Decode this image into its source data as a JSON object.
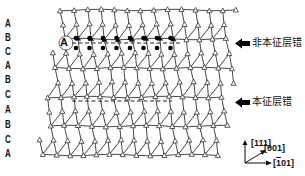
{
  "figure": {
    "stacking_sequence": [
      "A",
      "B",
      "C",
      "A",
      "B",
      "C",
      "A",
      "B",
      "C",
      "A"
    ],
    "layer_label_y": [
      19,
      33,
      47,
      61,
      75,
      90,
      105,
      120,
      135,
      149
    ],
    "extrinsic_fault": {
      "label": "非本征层错",
      "inserted_layer_label": "A",
      "y": 43,
      "x_start": 72,
      "x_end": 182
    },
    "intrinsic_fault": {
      "label": "本征层错",
      "y": 101,
      "x_start": 72,
      "x_end": 172
    },
    "axes": {
      "up": "[111]",
      "diag": "[001]",
      "right_prefix": "[",
      "right_bar": "1",
      "right_suffix": "01]"
    },
    "colors": {
      "line": "#333333",
      "atom_fill": "#ffffff",
      "fault_atom_fill": "#000000",
      "text": "#111111"
    },
    "lattice": {
      "rows": 11,
      "top_y": 10,
      "row_pitch": 14.5,
      "x_spacing": 13.5,
      "left_top_x": 60,
      "left_shift_per_row": -2.2,
      "cols": 14
    }
  }
}
